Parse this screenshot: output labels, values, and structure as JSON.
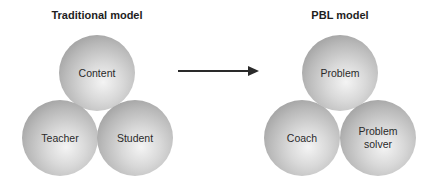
{
  "traditional": {
    "title": "Traditional model",
    "spheres": {
      "top": "Content",
      "left": "Teacher",
      "right": "Student"
    }
  },
  "arrow": {
    "direction": "right"
  },
  "pbl": {
    "title": "PBL model",
    "spheres": {
      "top": "Problem",
      "left": "Coach",
      "right_line1": "Problem",
      "right_line2": "solver"
    }
  }
}
